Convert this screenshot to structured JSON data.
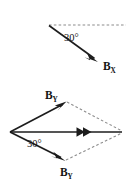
{
  "figure": {
    "background_color": "#ffffff",
    "vector_color": "#1c1c1c",
    "dashed_guide_color": "#8c8c8c",
    "width": 129,
    "height": 180
  },
  "diagram_top": {
    "name": "single-vector-component-diagram",
    "angle_label": "30°",
    "angle_value": 30,
    "angle_unit": "degrees",
    "vector_label_base": "B",
    "vector_label_subscript": "X",
    "vector_label_full": "BX",
    "dashed_reference": "horizontal",
    "vector_direction": "down-right",
    "origin": {
      "x": 49,
      "y": 25
    },
    "tip": {
      "x": 98,
      "y": 62
    },
    "dashed_start": {
      "x": 49,
      "y": 25
    },
    "dashed_end": {
      "x": 126,
      "y": 25
    }
  },
  "diagram_bottom": {
    "name": "parallelogram-vector-addition-diagram",
    "angle_label": "30°",
    "angle_value": 30,
    "angle_unit": "degrees",
    "upper_vector_label_base": "B",
    "upper_vector_label_subscript": "Y",
    "upper_vector_label_full": "BY",
    "lower_vector_label_base": "B",
    "lower_vector_label_subscript": "Y",
    "lower_vector_label_full": "BY",
    "resultant_arrowheads": 2,
    "origin": {
      "x": 10,
      "y": 132
    },
    "upper_tip": {
      "x": 66,
      "y": 102
    },
    "lower_tip": {
      "x": 65,
      "y": 161
    },
    "resultant_tip": {
      "x": 122,
      "y": 132
    },
    "dashed_upper_to_right": true,
    "dashed_lower_to_right": true
  }
}
